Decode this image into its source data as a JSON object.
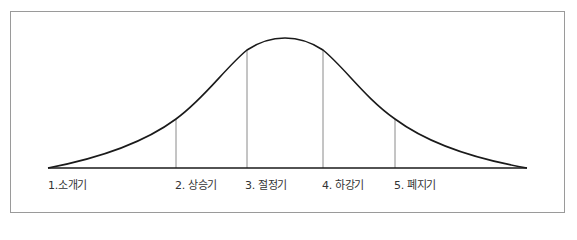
{
  "diagram": {
    "type": "product-life-cycle-curve",
    "colors": {
      "curve": "#1a1a1a",
      "baseline": "#1a1a1a",
      "dividers": "#8a8a8a",
      "frame": "#9a9a9a",
      "text": "#333333"
    },
    "stages": [
      {
        "label": "1.소개기",
        "x": 48
      },
      {
        "label": "2. 상승기",
        "x": 175
      },
      {
        "label": "3. 절정기",
        "x": 245
      },
      {
        "label": "4. 하강기",
        "x": 322
      },
      {
        "label": "5. 폐지기",
        "x": 394
      }
    ]
  }
}
